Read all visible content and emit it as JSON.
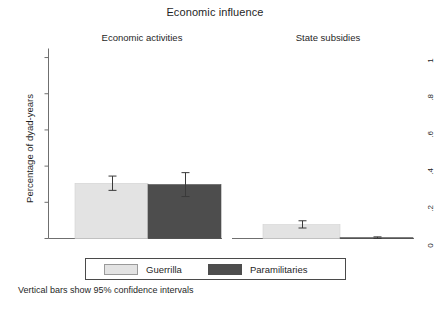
{
  "chart_data": {
    "type": "bar",
    "title": "Economic influence",
    "xlabel": "",
    "ylabel": "Percentage of dyad-years",
    "ylim": [
      0,
      1.05
    ],
    "ytick_labels": [
      "0",
      ".2",
      ".4",
      ".6",
      ".8",
      "1"
    ],
    "ytick_values": [
      0,
      0.2,
      0.4,
      0.6,
      0.8,
      1
    ],
    "grid": false,
    "legend_position": "bottom",
    "legend_entries": [
      "Guerrilla",
      "Paramilitaries"
    ],
    "colors": {
      "guerrilla": "#e3e3e3",
      "paramilitaries": "#4d4d4d",
      "axis": "#6f6f6f",
      "error_bar": "#3a3a3a",
      "text": "#1f1f1f"
    },
    "panels": [
      {
        "label": "Economic activities",
        "categories": [
          "Guerrilla",
          "Paramilitaries"
        ],
        "values": [
          0.305,
          0.298
        ],
        "ci_low": [
          0.266,
          0.232
        ],
        "ci_high": [
          0.345,
          0.364
        ]
      },
      {
        "label": "State subsidies",
        "categories": [
          "Guerrilla",
          "Paramilitaries"
        ],
        "values": [
          0.077,
          0.004
        ],
        "ci_low": [
          0.058,
          0.0
        ],
        "ci_high": [
          0.098,
          0.009
        ]
      }
    ],
    "annotation": "Vertical bars show 95% confidence intervals"
  },
  "figure": {
    "title": "Economic influence",
    "panel_titles": {
      "left": "Economic activities",
      "right": "State subsidies"
    },
    "y_axis_title": "Percentage of dyad-years",
    "ticks": {
      "t0": "0",
      "t1": ".2",
      "t2": ".4",
      "t3": ".6",
      "t4": ".8",
      "t5": "1"
    },
    "legend": {
      "guerrilla": "Guerrilla",
      "paramilitaries": "Paramilitaries"
    },
    "footnote": "Vertical bars show 95% confidence intervals"
  }
}
